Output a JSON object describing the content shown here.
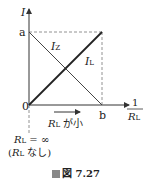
{
  "diagram": {
    "y_axis_label": "I",
    "x_axis_label_num": "1",
    "x_axis_label_den": "R",
    "x_axis_label_den_sub": "L",
    "y_tick_a": "a",
    "origin": "0",
    "x_tick_b": "b",
    "line_iz_label": "I",
    "line_iz_sub": "Z",
    "line_il_label": "I",
    "line_il_sub": "L",
    "arrow_label_R": "R",
    "arrow_label_sub": "L",
    "arrow_label_text": " が小",
    "rl_inf_R": "R",
    "rl_inf_sub": "L",
    "rl_inf_text": " = ∞",
    "rl_none_open": "(",
    "rl_none_R": "R",
    "rl_none_sub": "L",
    "rl_none_text": " なし)"
  },
  "caption": {
    "text": "図 7.27"
  },
  "colors": {
    "line": "#333333",
    "dashed": "#777777",
    "caption_square": "#888888"
  }
}
